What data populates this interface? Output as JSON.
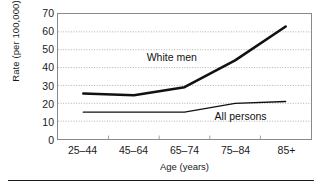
{
  "chart_data": {
    "type": "line",
    "title": "",
    "xlabel": "Age (years)",
    "ylabel": "Rate (per 100,000)",
    "categories": [
      "25–44",
      "45–64",
      "65–74",
      "75–84",
      "85+"
    ],
    "ylim": [
      0,
      70
    ],
    "yticks": [
      0,
      10,
      20,
      30,
      40,
      50,
      60,
      70
    ],
    "grid": "horizontal-dotted",
    "legend": "inline-annotations",
    "series": [
      {
        "name": "White men",
        "values": [
          25.5,
          24.5,
          29,
          44,
          63
        ],
        "style": "thick",
        "annotation": "White men"
      },
      {
        "name": "All persons",
        "values": [
          15,
          15,
          15,
          20,
          21
        ],
        "style": "thin",
        "annotation": "All persons"
      }
    ],
    "annotations": [
      {
        "text": "White men",
        "x_frac": 0.45,
        "y_value": 45.5
      },
      {
        "text": "All persons",
        "x_frac": 0.72,
        "y_value": 13.5
      }
    ],
    "colors": {
      "line": "#111111",
      "grid": "#9a9a9a",
      "frame": "#8a8a8a",
      "text": "#1a1a1a",
      "background": "#ffffff"
    }
  }
}
